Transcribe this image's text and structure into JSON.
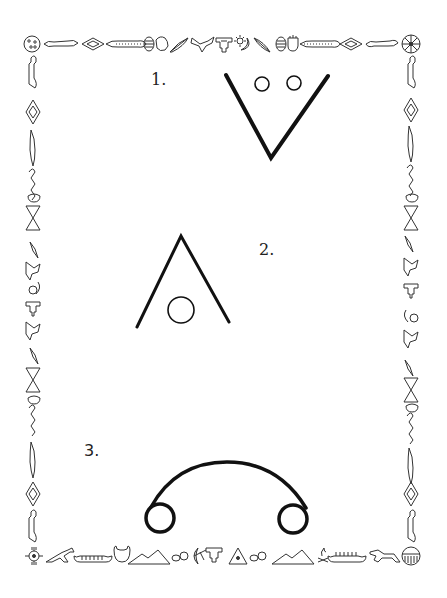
{
  "worksheet": {
    "items": [
      {
        "label": "1.",
        "shape": "v-with-two-circles"
      },
      {
        "label": "2.",
        "shape": "inverted-v-with-circle"
      },
      {
        "label": "3.",
        "shape": "arc-with-two-end-circles"
      }
    ],
    "border": {
      "style": "native-american-pictograph-border",
      "top_icons": [
        "sun-dots-icon",
        "lizard-icon",
        "diamond-icon",
        "beaded-band-icon",
        "drum-icon",
        "hand-icon",
        "feather-icon",
        "bird-icon",
        "thunderbird-icon",
        "sun-moon-icon",
        "feather-icon",
        "drum-icon",
        "hand-icon",
        "beaded-band-icon",
        "diamond-icon",
        "lizard-icon",
        "wheel-icon"
      ],
      "bottom_icons": [
        "zia-sun-icon",
        "horse-icon",
        "canoe-icon",
        "buffalo-head-icon",
        "mountains-icon",
        "tracks-icon",
        "moon-bow-icon",
        "thunderbird-icon",
        "tipi-icon",
        "tracks-icon",
        "mountains-icon",
        "campfire-icon",
        "canoe-icon",
        "horse-icon",
        "shield-icon"
      ],
      "side_icons": [
        "lizard-icon",
        "diamond-icon",
        "beaded-band-icon",
        "snake-icon",
        "hand-icon",
        "butterfly-icon",
        "feather-icon",
        "bird-icon",
        "sun-moon-icon",
        "thunderbird-icon",
        "bird-icon",
        "feather-icon",
        "butterfly-icon",
        "hand-icon",
        "snake-icon",
        "beaded-band-icon",
        "diamond-icon",
        "lizard-icon"
      ]
    },
    "colors": {
      "ink": "#111111",
      "paper": "#ffffff",
      "border_ink": "#333333"
    }
  }
}
